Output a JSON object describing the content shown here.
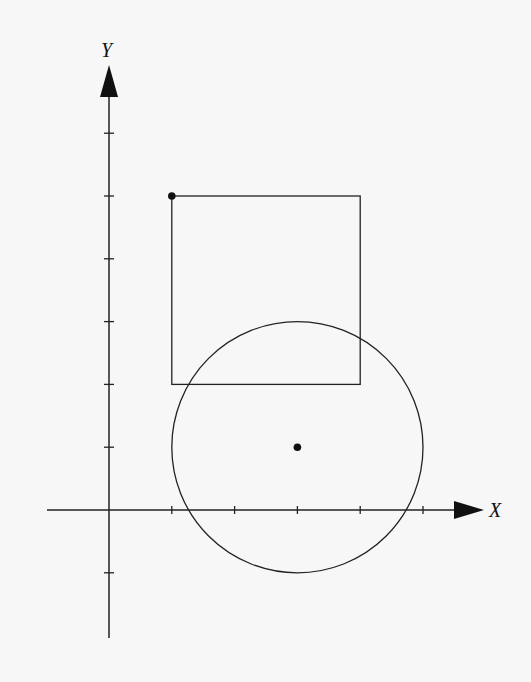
{
  "diagram": {
    "type": "coordinate-geometry",
    "axes": {
      "x_label": "X",
      "y_label": "Y",
      "origin_px": [
        109,
        510
      ],
      "unit_px": 62.8,
      "x_ticks": [
        1,
        2,
        3,
        4,
        5
      ],
      "y_ticks": [
        -1,
        1,
        2,
        3,
        4,
        5,
        6
      ],
      "x_range": [
        -1,
        5.9
      ],
      "y_range": [
        -2,
        7.1
      ]
    },
    "square": {
      "top_left": [
        1,
        5
      ],
      "bottom_right": [
        4,
        2
      ],
      "marked_vertex": [
        1,
        5
      ]
    },
    "circle": {
      "center": [
        3,
        1
      ],
      "radius": 2,
      "center_marked": true
    },
    "colors": {
      "stroke": "#222222",
      "background": "#f7f7f7"
    }
  }
}
